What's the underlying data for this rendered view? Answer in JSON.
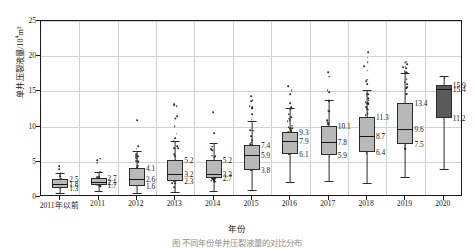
{
  "chart_data": {
    "type": "box",
    "title": "",
    "xlabel": "年份",
    "ylabel": "单井压裂液量/10⁴m³",
    "ylabel_base": "单井压裂液量/10",
    "ylabel_exp": "4",
    "ylabel_unit": "m³",
    "ylim": [
      0,
      25
    ],
    "yticks": [
      0,
      5,
      10,
      15,
      20,
      25
    ],
    "grid": true,
    "legend": "none",
    "categories": [
      "2011年以前",
      "2011",
      "2012",
      "2013",
      "2014",
      "2015",
      "2016",
      "2017",
      "2018",
      "2019",
      "2020"
    ],
    "boxes": [
      {
        "category": "2011年以前",
        "q3": 2.5,
        "median": 1.8,
        "q1": 1.3,
        "whisker_low": 0.6,
        "whisker_high": 3.4,
        "outlier_max": 4.6,
        "n": 34,
        "fill": "#b8b8b8"
      },
      {
        "category": "2011",
        "q3": 2.7,
        "median": 2.1,
        "q1": 1.7,
        "whisker_low": 0.9,
        "whisker_high": 3.6,
        "outlier_max": 6.2,
        "n": 58,
        "fill": "#b8b8b8"
      },
      {
        "category": "2012",
        "q3": 4.1,
        "median": 2.6,
        "q1": 1.6,
        "whisker_low": 0.5,
        "whisker_high": 6.5,
        "outlier_max": 12.3,
        "n": 78,
        "fill": "#b8b8b8"
      },
      {
        "category": "2013",
        "q3": 5.2,
        "median": 3.2,
        "q1": 2.3,
        "whisker_low": 0.7,
        "whisker_high": 8.0,
        "outlier_max": 14.0,
        "n": 96,
        "fill": "#b8b8b8"
      },
      {
        "category": "2014",
        "q3": 5.2,
        "median": 3.3,
        "q1": 2.7,
        "whisker_low": 0.8,
        "whisker_high": 7.6,
        "outlier_max": 15.9,
        "n": 88,
        "fill": "#b8b8b8"
      },
      {
        "category": "2015",
        "q3": 7.4,
        "median": 5.9,
        "q1": 3.8,
        "whisker_low": 1.0,
        "whisker_high": 10.8,
        "outlier_max": 14.8,
        "n": 120,
        "fill": "#b8b8b8"
      },
      {
        "category": "2016",
        "q3": 9.3,
        "median": 7.9,
        "q1": 6.1,
        "whisker_low": 2.1,
        "whisker_high": 12.6,
        "outlier_max": 17.6,
        "n": 132,
        "fill": "#b8b8b8"
      },
      {
        "category": "2017",
        "q3": 10.1,
        "median": 7.8,
        "q1": 5.9,
        "whisker_low": 2.3,
        "whisker_high": 13.8,
        "outlier_max": 19.8,
        "n": 140,
        "fill": "#b8b8b8"
      },
      {
        "category": "2018",
        "q3": 11.3,
        "median": 8.7,
        "q1": 6.4,
        "whisker_low": 2.0,
        "whisker_high": 15.2,
        "outlier_max": 21.5,
        "n": 150,
        "fill": "#b8b8b8"
      },
      {
        "category": "2019",
        "q3": 13.4,
        "median": 9.6,
        "q1": 7.5,
        "whisker_low": 2.8,
        "whisker_high": 17.6,
        "outlier_max": 19.4,
        "n": 126,
        "fill": "#b8b8b8"
      },
      {
        "category": "2020",
        "q3": 15.9,
        "median": 15.4,
        "q1": 11.2,
        "whisker_low": 4.0,
        "whisker_high": 17.2,
        "outlier_max": 17.2,
        "n": 6,
        "fill": "#5a5a5a"
      }
    ]
  },
  "caption": "图  不同年份单井压裂液量的对比分布"
}
